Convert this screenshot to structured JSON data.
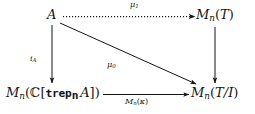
{
  "diagram": {
    "type": "commutative-diagram",
    "ink_color": "#141414",
    "background_color": "#ffffff",
    "nodes": [
      {
        "id": "A",
        "position": "top-left",
        "text": "A"
      },
      {
        "id": "MnT",
        "position": "top-right",
        "text": "Mn(T)",
        "base": "M",
        "subscript": "n",
        "argument": "T"
      },
      {
        "id": "MnCtrepnA",
        "position": "bottom-left",
        "text": "Mn(C[trep_n A])",
        "base": "M",
        "subscript": "n",
        "argument": "C[trep_n A]",
        "blackboard_symbol": "C",
        "typewriter_word": "trep",
        "typewriter_subscript": "n",
        "inner_variable": "A"
      },
      {
        "id": "MnTI",
        "position": "bottom-right",
        "text": "Mn(T/I)",
        "base": "M",
        "subscript": "n",
        "argument": "T/I"
      }
    ],
    "arrows": [
      {
        "id": "top",
        "from": "A",
        "to": "MnT",
        "style": "dotted",
        "direction": "right",
        "label": "mu1",
        "label_base": "μ",
        "label_subscript": "1",
        "label_position": "above"
      },
      {
        "id": "left",
        "from": "A",
        "to": "MnCtrepnA",
        "style": "solid",
        "direction": "down",
        "label": "iA",
        "label_base": "i",
        "label_subscript": "A",
        "label_position": "left"
      },
      {
        "id": "diagonal",
        "from": "A",
        "to": "MnTI",
        "style": "solid",
        "direction": "down-right",
        "label": "mu0",
        "label_base": "μ",
        "label_subscript": "0",
        "label_position": "below"
      },
      {
        "id": "right",
        "from": "MnT",
        "to": "MnTI",
        "style": "solid",
        "direction": "down",
        "label": "",
        "label_position": "none"
      },
      {
        "id": "bottom",
        "from": "MnCtrepnA",
        "to": "MnTI",
        "style": "solid",
        "direction": "right",
        "label": "Mn(kappa)",
        "label_base": "M",
        "label_subscript": "n",
        "label_argument": "κ",
        "label_position": "below"
      }
    ]
  },
  "labels": {
    "node_A": "A",
    "node_MnT_base": "M",
    "node_MnT_sub": "n",
    "node_MnT_open": "(",
    "node_MnT_arg": "T",
    "node_MnT_close": ")",
    "node_MnCtrep_base": "M",
    "node_MnCtrep_sub": "n",
    "node_MnCtrep_open": "(",
    "node_MnCtrep_blackboard": "ℂ",
    "node_MnCtrep_bracket_open": "[",
    "node_MnCtrep_tt": "trep",
    "node_MnCtrep_tt_sub": "n",
    "node_MnCtrep_var": "A",
    "node_MnCtrep_bracket_close": "]",
    "node_MnCtrep_close": ")",
    "node_MnTI_base": "M",
    "node_MnTI_sub": "n",
    "node_MnTI_open": "(",
    "node_MnTI_arg": "T/I",
    "node_MnTI_close": ")",
    "mu1_base": "μ",
    "mu1_sub": "1",
    "mu0_base": "μ",
    "mu0_sub": "0",
    "iA_base": "i",
    "iA_sub": "A",
    "mnkappa_base": "M",
    "mnkappa_sub": "n",
    "mnkappa_open": "(",
    "mnkappa_arg": "κ",
    "mnkappa_close": ")"
  }
}
